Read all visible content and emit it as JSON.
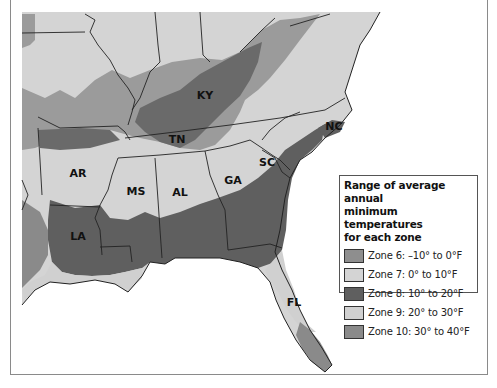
{
  "map": {
    "title": "Plant hardiness zones of the southeastern United States",
    "states": [
      {
        "abbr": "KY",
        "x": 205,
        "y": 95
      },
      {
        "abbr": "TN",
        "x": 177,
        "y": 139
      },
      {
        "abbr": "NC",
        "x": 334,
        "y": 126
      },
      {
        "abbr": "SC",
        "x": 267,
        "y": 162
      },
      {
        "abbr": "AR",
        "x": 78,
        "y": 173
      },
      {
        "abbr": "MS",
        "x": 136,
        "y": 191
      },
      {
        "abbr": "AL",
        "x": 180,
        "y": 192
      },
      {
        "abbr": "GA",
        "x": 233,
        "y": 180
      },
      {
        "abbr": "LA",
        "x": 78,
        "y": 236
      },
      {
        "abbr": "FL",
        "x": 294,
        "y": 302
      }
    ]
  },
  "legend": {
    "title_line1": "Range of average annual",
    "title_line2": "minimum temperatures",
    "title_line3": "for each zone",
    "zones": [
      {
        "label": "Zone 6: –10° to 0°F",
        "color": "#8e8e8e"
      },
      {
        "label": "Zone 7: 0° to 10°F",
        "color": "#d4d4d4"
      },
      {
        "label": "Zone 8: 10° to 20°F",
        "color": "#5f5f5f"
      },
      {
        "label": "Zone 9: 20° to 30°F",
        "color": "#d0d0d0"
      },
      {
        "label": "Zone 10: 30° to 40°F",
        "color": "#8a8a8a"
      }
    ]
  }
}
